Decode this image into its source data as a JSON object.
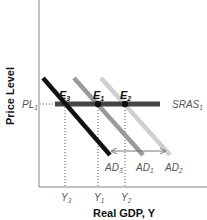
{
  "diagram": {
    "y_axis_label": "Price Level",
    "x_axis_label": "Real GDP, Y",
    "price_level": {
      "base": "PL",
      "sub": "1"
    },
    "supply_curve": {
      "base": "SRAS",
      "sub": "1",
      "color": "#444444"
    },
    "demand_curves": [
      {
        "id": "AD3",
        "base": "AD",
        "sub": "3",
        "color": "#111111"
      },
      {
        "id": "AD1",
        "base": "AD",
        "sub": "1",
        "color": "#9a9a9a"
      },
      {
        "id": "AD2",
        "base": "AD",
        "sub": "2",
        "color": "#cfcfcf"
      }
    ],
    "equilibria": [
      {
        "base": "E",
        "sub": "3"
      },
      {
        "base": "E",
        "sub": "1"
      },
      {
        "base": "E",
        "sub": "2"
      }
    ],
    "output_levels": [
      {
        "base": "Y",
        "sub": "3"
      },
      {
        "base": "Y",
        "sub": "1"
      },
      {
        "base": "Y",
        "sub": "2"
      }
    ],
    "shift_arrow": "double-headed-horizontal-arrow"
  }
}
